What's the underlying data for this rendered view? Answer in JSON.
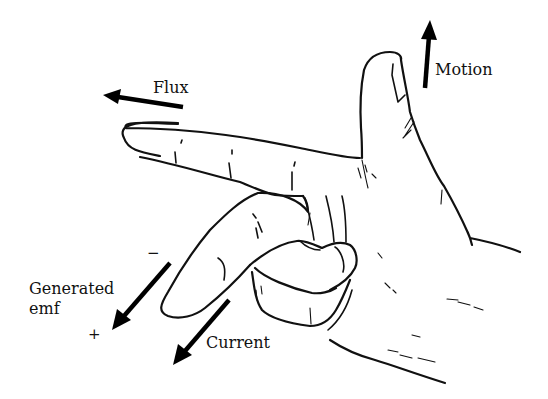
{
  "figure": {
    "ink_color": "#111111",
    "background": "#ffffff"
  },
  "labels": {
    "flux": "Flux",
    "motion": "Motion",
    "generated_emf_line1": "Generated",
    "generated_emf_line2": "emf",
    "minus_sign": "−",
    "plus_sign": "+",
    "current": "Current"
  },
  "arrows": [
    {
      "name": "flux-arrow",
      "direction": "left",
      "from": [
        183,
        107
      ],
      "to": [
        103,
        95
      ]
    },
    {
      "name": "motion-arrow",
      "direction": "up",
      "from": [
        425,
        88
      ],
      "to": [
        430,
        20
      ]
    },
    {
      "name": "emf-arrow",
      "direction": "down-left",
      "from": [
        170,
        263
      ],
      "to": [
        112,
        330
      ]
    },
    {
      "name": "current-arrow",
      "direction": "down-left",
      "from": [
        229,
        300
      ],
      "to": [
        173,
        365
      ]
    }
  ]
}
